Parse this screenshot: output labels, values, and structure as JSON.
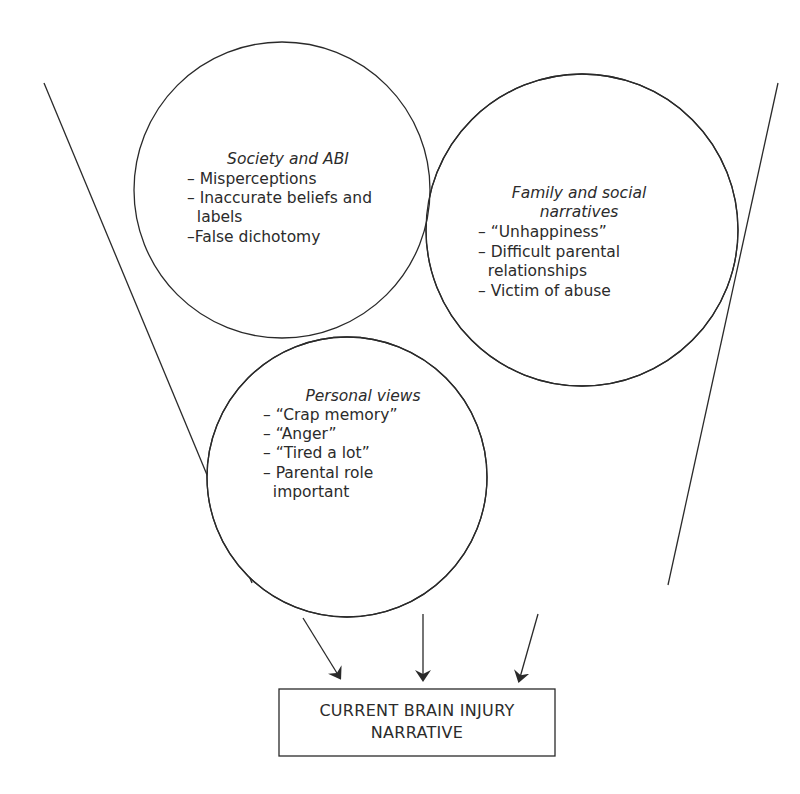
{
  "diagram": {
    "circles": [
      {
        "id": "society",
        "title": "Society and ABI",
        "items": [
          "– Misperceptions",
          "– Inaccurate beliefs and",
          "  labels",
          "–False dichotomy"
        ]
      },
      {
        "id": "family",
        "title_line1": "Family and social",
        "title_line2": "narratives",
        "items": [
          "– “Unhappiness”",
          "– Difficult parental",
          "  relationships",
          "– Victim of abuse"
        ]
      },
      {
        "id": "personal",
        "title": "Personal views",
        "items": [
          "– “Crap memory”",
          "– “Anger”",
          "– “Tired a lot”",
          "– Parental role",
          "  important"
        ]
      }
    ],
    "output_box": {
      "line1": "CURRENT BRAIN INJURY",
      "line2": "NARRATIVE"
    },
    "colors": {
      "stroke": "#2a2a2a",
      "text": "#2b2b2b",
      "background": "#ffffff"
    }
  }
}
